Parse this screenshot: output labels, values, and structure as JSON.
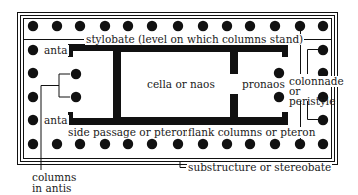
{
  "labels": {
    "stylobate": "stylobate (level on which columns stand)",
    "anta_top": "anta",
    "anta_bottom": "anta",
    "cella": "cella or naos",
    "pronaos": "pronaos",
    "colonnade_1": "colonnade",
    "colonnade_2": "or",
    "colonnade_3": "peristyle",
    "side_passage": "side passage or pteroma",
    "flank_columns": "flank columns or pteron",
    "substructure": "substructure or stereobate",
    "columns_in_antis_1": "columns",
    "columns_in_antis_2": "in antis"
  },
  "colors": {
    "ink": "#111111",
    "background": "#ffffff"
  },
  "columns": {
    "top_row_x": [
      33,
      57,
      80,
      105,
      128,
      152,
      178,
      203,
      227,
      250,
      275,
      300,
      323
    ],
    "top_row_y": 26,
    "bottom_row_y": 144,
    "left_col_x": 33,
    "right_col_x": 323,
    "side_y": [
      50,
      73,
      97,
      120
    ],
    "antis_left": [
      {
        "x": 76,
        "y": 74
      },
      {
        "x": 76,
        "y": 97
      }
    ],
    "antis_right": [
      {
        "x": 279,
        "y": 73
      },
      {
        "x": 279,
        "y": 97
      }
    ]
  }
}
